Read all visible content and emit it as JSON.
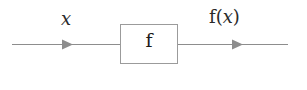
{
  "figure": {
    "background_color": "#ffffff",
    "width": 307,
    "height": 90
  },
  "diagram": {
    "type": "block-diagram",
    "wire_color": "#8d8d8d",
    "box_border_color": "#9b9b9b",
    "box_fill_color": "#ffffff",
    "text_color": "#2a2a2a",
    "input_label": "x",
    "output_label_function": "f",
    "output_label_open_paren": "(",
    "output_label_variable": "x",
    "output_label_close_paren": ")",
    "box_label": "f",
    "nodes": [
      {
        "name": "input-wire",
        "kind": "arrow",
        "from_x": 12,
        "to_x": 120,
        "y": 44,
        "arrowhead_x": 72,
        "label": "x"
      },
      {
        "name": "function-box",
        "kind": "rect",
        "x": 120,
        "y": 24,
        "width": 58,
        "height": 40,
        "label": "f"
      },
      {
        "name": "output-wire",
        "kind": "arrow",
        "from_x": 178,
        "to_x": 288,
        "y": 44,
        "arrowhead_x": 242,
        "label": "f(x)"
      }
    ]
  }
}
